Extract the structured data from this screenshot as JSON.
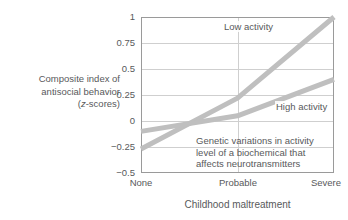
{
  "chart_data": {
    "type": "line",
    "title": "",
    "xlabel": "Childhood maltreatment",
    "ylabel": "Composite index of antisocial behavior (z-scores)",
    "ylabel_lines": [
      "Composite index of",
      "antisocial behavior",
      "(z-scores)"
    ],
    "ylabel_italic_token": "z",
    "categories": [
      "None",
      "Probable",
      "Severe"
    ],
    "x": [
      0,
      1,
      2
    ],
    "xtick_labels": [
      "None",
      "Probable",
      "Severe"
    ],
    "ytick_labels": [
      "1",
      "0.75",
      "0.5",
      "0.25",
      "0",
      "−0.25",
      "−0.5"
    ],
    "ytick_values": [
      1,
      0.75,
      0.5,
      0.25,
      0,
      -0.25,
      -0.5
    ],
    "ylim": [
      -0.5,
      1
    ],
    "xlim": [
      0,
      2
    ],
    "grid": true,
    "grid_axis": "both",
    "legend": "inline-labels",
    "legend_position": "inside-plot",
    "series": [
      {
        "name": "Low activity",
        "values": [
          -0.27,
          0.22,
          1.0
        ],
        "color": "#bfbfbf",
        "linewidth": 5
      },
      {
        "name": "High activity",
        "values": [
          -0.1,
          0.05,
          0.4
        ],
        "color": "#bfbfbf",
        "linewidth": 5
      }
    ],
    "annotations": [
      {
        "name": "genetic-variation-note",
        "lines": [
          "Genetic variations in activity",
          "level of a biochemical that",
          "affects neurotransmitters"
        ]
      }
    ],
    "colors": {
      "line": "#bfbfbf",
      "text": "#58595b",
      "axis": "#9a9a9a",
      "grid": "#cfcfcf",
      "background": "#ffffff"
    }
  }
}
